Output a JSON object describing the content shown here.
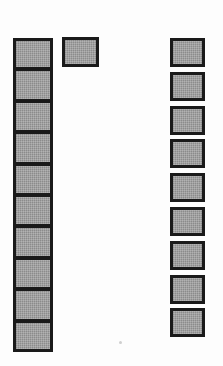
{
  "diagram": {
    "background_color": "#fdfdfd",
    "cell_fill_color": "#9b9b9b",
    "cell_border_color": "#1a1a1a",
    "canvas": {
      "width": 223,
      "height": 366
    },
    "groups": [
      {
        "id": "left-strip",
        "label": "Left contiguous strip",
        "kind": "contiguous-column",
        "count": 10,
        "x": 13,
        "y": 38,
        "width": 40,
        "cell_height": 31.4,
        "gap": 0,
        "cells": [
          {
            "index": 1,
            "label": ""
          },
          {
            "index": 2,
            "label": ""
          },
          {
            "index": 3,
            "label": ""
          },
          {
            "index": 4,
            "label": ""
          },
          {
            "index": 5,
            "label": ""
          },
          {
            "index": 6,
            "label": ""
          },
          {
            "index": 7,
            "label": ""
          },
          {
            "index": 8,
            "label": ""
          },
          {
            "index": 9,
            "label": ""
          },
          {
            "index": 10,
            "label": ""
          }
        ]
      },
      {
        "id": "top-middle-box",
        "label": "Single middle box",
        "kind": "single-box",
        "count": 1,
        "x": 62,
        "y": 37,
        "width": 37,
        "cell_height": 30,
        "gap": 0,
        "cells": [
          {
            "index": 1,
            "label": ""
          }
        ]
      },
      {
        "id": "right-column",
        "label": "Right spaced column",
        "kind": "spaced-column",
        "count": 9,
        "x": 170,
        "y": 38,
        "width": 35,
        "cell_height": 29,
        "gap": 4.8,
        "cells": [
          {
            "index": 1,
            "label": ""
          },
          {
            "index": 2,
            "label": ""
          },
          {
            "index": 3,
            "label": ""
          },
          {
            "index": 4,
            "label": ""
          },
          {
            "index": 5,
            "label": ""
          },
          {
            "index": 6,
            "label": ""
          },
          {
            "index": 7,
            "label": ""
          },
          {
            "index": 8,
            "label": ""
          },
          {
            "index": 9,
            "label": ""
          }
        ]
      }
    ],
    "artifacts": [
      {
        "id": "scan-speck",
        "x": 119,
        "y": 341,
        "size": 3
      }
    ]
  }
}
